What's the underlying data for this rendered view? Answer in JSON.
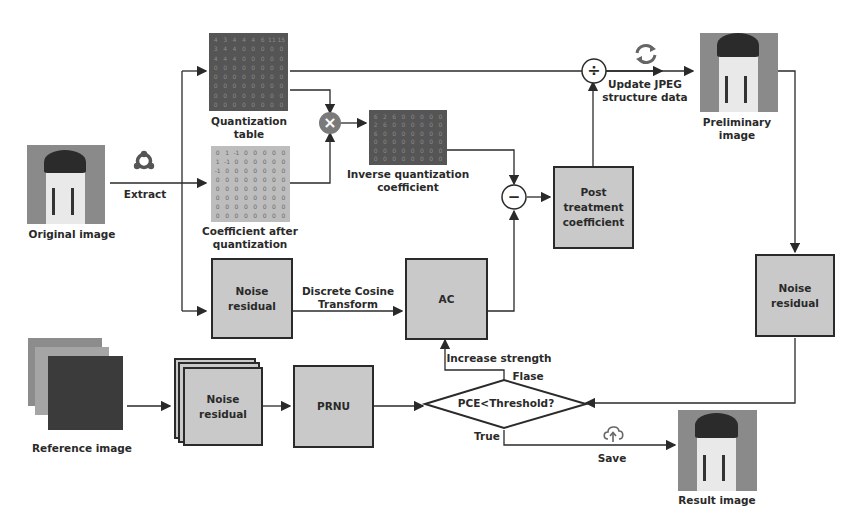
{
  "diagram": {
    "images": {
      "original": "Original image",
      "preliminary": "Preliminary image",
      "reference": "Reference image",
      "result": "Result image"
    },
    "matrices": {
      "quantization_table": "Quantization table",
      "coefficient_after_quantization": "Coefficient after quantization",
      "inverse_quantization_coefficient": "Inverse quantization coefficient"
    },
    "boxes": {
      "noise_residual_top": "Noise residual",
      "ac": "AC",
      "post_treatment": "Post treatment coefficient",
      "noise_residual_right": "Noise residual",
      "noise_residual_stack": "Noise residual",
      "prnu": "PRNU"
    },
    "decision": {
      "condition": "PCE<Threshold?",
      "false_label": "Flase",
      "true_label": "True"
    },
    "edge_labels": {
      "extract": "Extract",
      "dct": "Discrete Cosine Transform",
      "update": "Update JPEG structure data",
      "increase": "Increase strength",
      "save": "Save"
    },
    "operators": {
      "multiply": "×",
      "subtract": "−",
      "divide": "÷"
    },
    "icons": {
      "extract": "share-icon",
      "update": "refresh-icon",
      "save": "cloud-upload-icon"
    },
    "grid_values": {
      "quant_row": [
        "4",
        "3",
        "4",
        "4",
        "4",
        "6",
        "11",
        "15"
      ],
      "coef_row": [
        "0",
        "1",
        "-1",
        "0",
        "0",
        "0",
        "0",
        "0"
      ],
      "inv_row": [
        "6",
        "2",
        "6",
        "0",
        "0",
        "0",
        "0",
        "0"
      ]
    },
    "colors": {
      "box_fill": "#c9c9c9",
      "stroke": "#2a2a2a",
      "multiply_node": "#7a7a7a"
    }
  }
}
